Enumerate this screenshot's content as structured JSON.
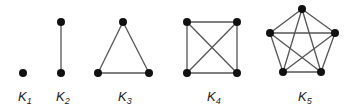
{
  "diagram": {
    "edge_color": "#555555",
    "node_color": "#111111",
    "graphs": [
      {
        "name": "K1",
        "label_main": "K",
        "label_sub": "1",
        "label_pos": [
          18,
          101
        ],
        "nodes": [
          [
            23,
            73
          ]
        ],
        "edges": []
      },
      {
        "name": "K2",
        "label_main": "K",
        "label_sub": "2",
        "label_pos": [
          56,
          101
        ],
        "nodes": [
          [
            61,
            22
          ],
          [
            61,
            73
          ]
        ],
        "edges": [
          [
            0,
            1
          ]
        ]
      },
      {
        "name": "K3",
        "label_main": "K",
        "label_sub": "3",
        "label_pos": [
          118,
          101
        ],
        "nodes": [
          [
            123,
            22
          ],
          [
            98,
            73
          ],
          [
            149,
            73
          ]
        ],
        "edges": [
          [
            0,
            1
          ],
          [
            0,
            2
          ],
          [
            1,
            2
          ]
        ]
      },
      {
        "name": "K4",
        "label_main": "K",
        "label_sub": "4",
        "label_pos": [
          207,
          101
        ],
        "nodes": [
          [
            187,
            22
          ],
          [
            237,
            22
          ],
          [
            187,
            73
          ],
          [
            237,
            73
          ]
        ],
        "edges": [
          [
            0,
            1
          ],
          [
            0,
            2
          ],
          [
            0,
            3
          ],
          [
            1,
            2
          ],
          [
            1,
            3
          ],
          [
            2,
            3
          ]
        ]
      },
      {
        "name": "K5",
        "label_main": "K",
        "label_sub": "5",
        "label_pos": [
          298,
          101
        ],
        "nodes": [
          [
            302,
            9
          ],
          [
            270,
            33
          ],
          [
            335,
            33
          ],
          [
            283,
            72
          ],
          [
            321,
            72
          ]
        ],
        "edges": [
          [
            0,
            1
          ],
          [
            0,
            2
          ],
          [
            0,
            3
          ],
          [
            0,
            4
          ],
          [
            1,
            2
          ],
          [
            1,
            3
          ],
          [
            1,
            4
          ],
          [
            2,
            3
          ],
          [
            2,
            4
          ],
          [
            3,
            4
          ]
        ]
      }
    ]
  }
}
